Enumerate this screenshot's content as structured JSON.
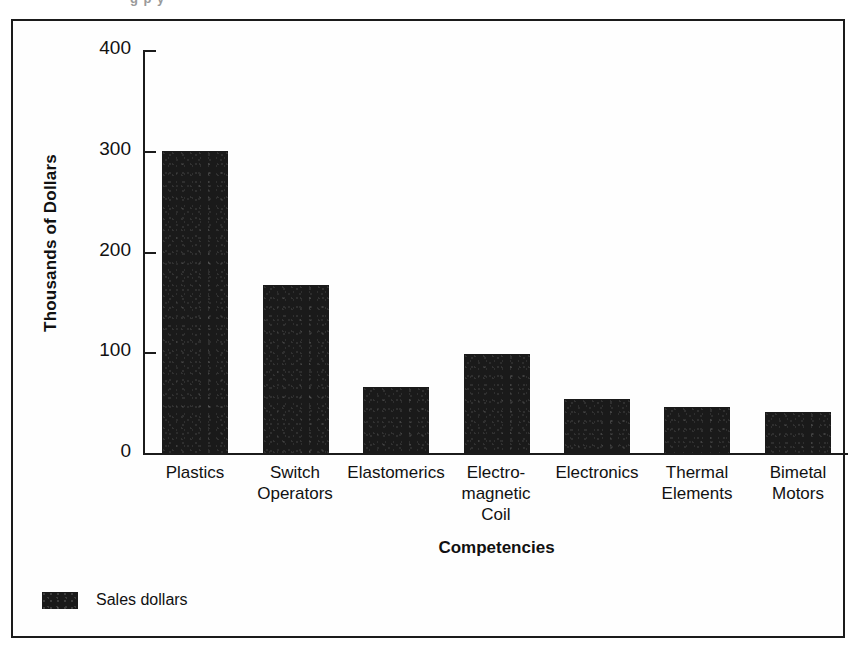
{
  "scan_artifact": {
    "partial_text": "g   p y"
  },
  "chart_data": {
    "type": "bar",
    "title": "",
    "xlabel": "Competencies",
    "ylabel": "Thousands of Dollars",
    "categories": [
      "Plastics",
      "Switch\nOperators",
      "Elastomerics",
      "Electro-\nmagnetic\nCoil",
      "Electronics",
      "Thermal\nElements",
      "Bimetal\nMotors"
    ],
    "values": [
      300,
      167,
      66,
      98,
      54,
      46,
      41
    ],
    "series": [
      {
        "name": "Sales dollars",
        "color": "#1a1a1a",
        "values": [
          300,
          167,
          66,
          98,
          54,
          46,
          41
        ]
      }
    ],
    "ylim": [
      0,
      400
    ],
    "yticks": [
      0,
      100,
      200,
      300,
      400
    ],
    "ytick_labels": [
      "0",
      "100",
      "200",
      "300",
      "400"
    ],
    "grid": false,
    "legend": {
      "position": "bottom-left",
      "entries": [
        {
          "label": "Sales dollars",
          "color": "#1a1a1a"
        }
      ]
    }
  },
  "colors": {
    "bar": "#1a1a1a",
    "axis": "#1b1b1b",
    "frame": "#1b1b1b",
    "background": "#ffffff",
    "text": "#111111"
  }
}
